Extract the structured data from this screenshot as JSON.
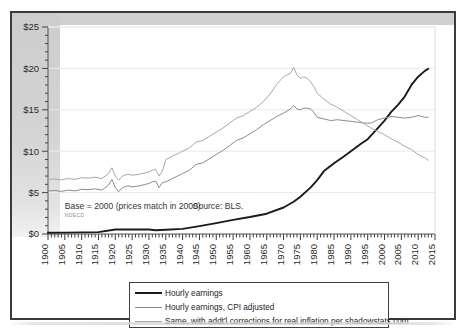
{
  "chart_data": {
    "type": "line",
    "title": "",
    "xlabel": "",
    "ylabel": "",
    "xlim": [
      1900,
      2015
    ],
    "ylim": [
      0,
      25
    ],
    "grid": true,
    "legend_position": "bottom-center",
    "y_tick_labels": [
      "$25",
      "$20",
      "$15",
      "$10",
      "$5",
      "$0"
    ],
    "y_ticks": [
      25,
      20,
      15,
      10,
      5,
      0
    ],
    "y_minor_tick_step": 1,
    "x_tick_labels": [
      "1900",
      "1905",
      "1910",
      "1915",
      "1920",
      "1925",
      "1930",
      "1935",
      "1940",
      "1945",
      "1950",
      "1955",
      "1960",
      "1965",
      "1970",
      "1975",
      "1980",
      "1985",
      "1990",
      "1995",
      "2000",
      "2005",
      "2010",
      "2015"
    ],
    "x_minor_tick_step": 1,
    "annotations": [
      {
        "name": "base-note",
        "text": "Base = 2000 (prices match in 2000)",
        "x": 1905,
        "y": 3.0
      },
      {
        "name": "source-note",
        "text": "Source: BLS.",
        "x": 1943,
        "y": 3.0
      },
      {
        "name": "faint-watermark",
        "text": "NDECD",
        "x": 1905,
        "y": 2.1
      }
    ],
    "series": [
      {
        "name": "Hourly earnings",
        "color": "#1b1b1b",
        "width": 1.9,
        "x": [
          1900,
          1905,
          1910,
          1915,
          1920,
          1925,
          1930,
          1932,
          1935,
          1940,
          1945,
          1950,
          1955,
          1960,
          1965,
          1970,
          1973,
          1975,
          1978,
          1980,
          1982,
          1985,
          1988,
          1990,
          1993,
          1995,
          1998,
          2000,
          2002,
          2004,
          2006,
          2008,
          2010,
          2012,
          2013
        ],
        "values": [
          0.15,
          0.17,
          0.2,
          0.23,
          0.55,
          0.54,
          0.55,
          0.45,
          0.52,
          0.62,
          0.95,
          1.32,
          1.7,
          2.05,
          2.45,
          3.2,
          3.9,
          4.5,
          5.6,
          6.5,
          7.6,
          8.55,
          9.4,
          10.0,
          10.9,
          11.45,
          12.8,
          13.7,
          14.75,
          15.6,
          16.6,
          18.0,
          19.0,
          19.7,
          19.95
        ]
      },
      {
        "name": "Hourly earnings, CPI adjusted",
        "color": "#8c8c8c",
        "width": 1.0,
        "x": [
          1900,
          1902,
          1904,
          1906,
          1908,
          1910,
          1912,
          1914,
          1916,
          1918,
          1919,
          1920,
          1921,
          1922,
          1923,
          1924,
          1925,
          1927,
          1929,
          1930,
          1931,
          1932,
          1933,
          1934,
          1935,
          1937,
          1939,
          1940,
          1942,
          1944,
          1946,
          1948,
          1950,
          1952,
          1954,
          1956,
          1958,
          1960,
          1962,
          1964,
          1966,
          1968,
          1970,
          1972,
          1973,
          1974,
          1975,
          1976,
          1977,
          1978,
          1979,
          1980,
          1982,
          1984,
          1986,
          1988,
          1990,
          1992,
          1994,
          1996,
          1998,
          2000,
          2002,
          2004,
          2006,
          2008,
          2010,
          2012,
          2013
        ],
        "values": [
          5.2,
          5.25,
          5.15,
          5.3,
          5.2,
          5.4,
          5.35,
          5.45,
          5.3,
          5.9,
          6.6,
          5.6,
          5.1,
          5.55,
          5.75,
          5.8,
          5.7,
          5.8,
          6.0,
          6.1,
          6.3,
          6.4,
          5.6,
          6.2,
          6.3,
          6.7,
          7.1,
          7.3,
          7.7,
          8.4,
          8.6,
          9.1,
          9.6,
          10.1,
          10.7,
          11.3,
          11.6,
          12.1,
          12.6,
          13.2,
          13.7,
          14.2,
          14.6,
          15.1,
          15.5,
          15.1,
          15.0,
          15.2,
          15.2,
          15.1,
          14.7,
          14.1,
          13.9,
          13.7,
          13.8,
          13.7,
          13.6,
          13.5,
          13.4,
          13.4,
          13.8,
          14.0,
          14.2,
          14.1,
          14.0,
          14.1,
          14.3,
          14.1,
          14.1
        ]
      },
      {
        "name": "Same, with addt'l corrections for real inflation per shadowstats.com",
        "color": "#a8a8a8",
        "width": 1.0,
        "x": [
          1900,
          1902,
          1904,
          1906,
          1908,
          1910,
          1912,
          1914,
          1916,
          1918,
          1919,
          1920,
          1921,
          1922,
          1923,
          1924,
          1925,
          1927,
          1929,
          1930,
          1931,
          1932,
          1933,
          1934,
          1935,
          1937,
          1939,
          1940,
          1942,
          1944,
          1946,
          1948,
          1950,
          1952,
          1954,
          1956,
          1958,
          1960,
          1962,
          1964,
          1966,
          1968,
          1970,
          1972,
          1973,
          1974,
          1975,
          1976,
          1977,
          1978,
          1979,
          1980,
          1982,
          1984,
          1986,
          1988,
          1990,
          1992,
          1994,
          1996,
          1998,
          2000,
          2002,
          2004,
          2006,
          2008,
          2010,
          2012,
          2013
        ],
        "values": [
          6.6,
          6.65,
          6.55,
          6.7,
          6.6,
          6.8,
          6.75,
          6.85,
          6.7,
          7.3,
          8.0,
          7.0,
          6.5,
          6.95,
          7.15,
          7.2,
          7.1,
          7.2,
          7.4,
          7.5,
          7.7,
          7.8,
          7.0,
          7.6,
          9.0,
          9.4,
          9.8,
          10.0,
          10.4,
          11.1,
          11.3,
          11.8,
          12.3,
          12.8,
          13.4,
          14.0,
          14.3,
          14.8,
          15.3,
          16.0,
          16.9,
          18.1,
          19.0,
          19.4,
          20.1,
          19.2,
          18.8,
          19.0,
          18.8,
          18.4,
          17.8,
          17.0,
          16.3,
          15.7,
          15.3,
          14.8,
          14.3,
          13.8,
          13.3,
          12.8,
          12.4,
          12.0,
          11.5,
          11.1,
          10.6,
          10.2,
          9.6,
          9.2,
          8.9
        ]
      }
    ]
  },
  "legend": {
    "entries": [
      {
        "label": "Hourly earnings"
      },
      {
        "label": "Hourly earnings, CPI adjusted"
      },
      {
        "label": "Same, with addt'l corrections for real inflation per shadowstats.com"
      }
    ]
  }
}
